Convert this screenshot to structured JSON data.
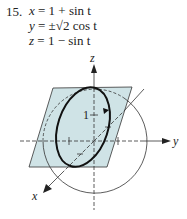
{
  "problem": {
    "number": "15.",
    "equations": [
      {
        "lhs": "x",
        "rhs": "= 1 + sin t"
      },
      {
        "lhs": "y",
        "rhs": "= ±√2 cos t"
      },
      {
        "lhs": "z",
        "rhs": "= 1 − sin t"
      }
    ]
  },
  "figure": {
    "axes": {
      "x": "x",
      "y": "y",
      "z": "z"
    },
    "tick_label": "1",
    "plane_color": "#cfe3e6",
    "curve_color": "#111111"
  }
}
